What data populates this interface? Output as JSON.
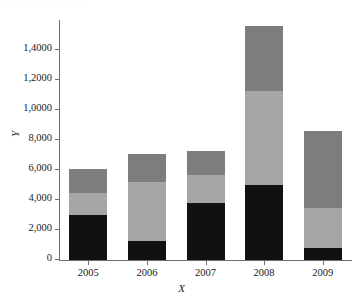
{
  "figure": {
    "caption_artifact": "· ·· ·· ··     ·· ·         ·      ··      ·· ·       ·    ·· ·"
  },
  "chart_data": {
    "type": "bar",
    "stacked": true,
    "title": "",
    "xlabel": "X",
    "ylabel": "Y",
    "categories": [
      "2005",
      "2006",
      "2007",
      "2008",
      "2009"
    ],
    "series": [
      {
        "name": "series-1",
        "color": "#111111",
        "values": [
          3000,
          1300,
          3800,
          5000,
          800
        ]
      },
      {
        "name": "series-2",
        "color": "#a6a6a6",
        "values": [
          1500,
          3900,
          1900,
          6300,
          2700
        ]
      },
      {
        "name": "series-3",
        "color": "#7d7d7d",
        "values": [
          1600,
          1900,
          1600,
          4300,
          5100
        ]
      }
    ],
    "totals": [
      6100,
      7100,
      7300,
      15600,
      8600
    ],
    "ylim": [
      0,
      16000
    ],
    "ytick_values": [
      0,
      2000,
      4000,
      6000,
      8000,
      10000,
      12000,
      14000
    ],
    "ytick_labels": [
      "0",
      "2,000",
      "4,000",
      "6,000",
      "8,000",
      "1,0000",
      "1,2000",
      "1,4000"
    ],
    "grid": false,
    "legend": "none"
  }
}
